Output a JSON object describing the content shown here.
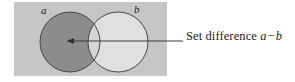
{
  "figure": {
    "type": "venn-diagram",
    "panel": {
      "background_color": "#c6c6c6",
      "x": 14,
      "y": 2,
      "width": 153,
      "height": 74
    },
    "circles": [
      {
        "id": "a",
        "label": "a",
        "cx": 70,
        "cy": 42,
        "r": 30,
        "stroke_color": "#3a3a3a",
        "fill_color": "#8c8c8c",
        "shaded": true
      },
      {
        "id": "b",
        "label": "b",
        "cx": 118,
        "cy": 42,
        "r": 30,
        "stroke_color": "#3a3a3a",
        "fill_color": "#e0e0e0",
        "shaded": false
      }
    ],
    "shaded_region": {
      "description": "a minus b",
      "color": "#8c8c8c"
    },
    "overlap_region": {
      "description": "a intersect b",
      "color": "#d5d5d5"
    },
    "annotation": {
      "arrow": {
        "from_x": 183,
        "from_y": 41,
        "to_x": 68,
        "to_y": 41,
        "color": "#3a3a3a"
      },
      "caption_prefix": "Set difference",
      "caption_left_operand": "a",
      "caption_operator": "−",
      "caption_right_operand": "b",
      "caption_full": "Set difference a − b"
    }
  }
}
